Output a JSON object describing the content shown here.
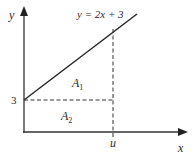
{
  "diagram": {
    "axes": {
      "x_label": "x",
      "y_label": "y"
    },
    "line": {
      "equation": "y = 2x + 3"
    },
    "ticks": {
      "y_intercept": "3",
      "x_mark": "u"
    },
    "regions": {
      "a1": "A",
      "a1_sub": "1",
      "a2": "A",
      "a2_sub": "2"
    },
    "colors": {
      "stroke": "#2a2a2a",
      "background": "#ffffff"
    }
  }
}
